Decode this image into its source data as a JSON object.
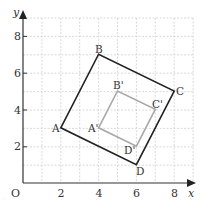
{
  "diagram": {
    "type": "coordinate-grid-enlargement",
    "axes": {
      "x_label": "x",
      "y_label": "y",
      "origin_label": "O",
      "x_ticks": [
        "2",
        "4",
        "6",
        "8"
      ],
      "y_ticks": [
        "2",
        "4",
        "6",
        "8"
      ],
      "x_range": [
        0,
        9
      ],
      "y_range": [
        0,
        9
      ],
      "grid": true
    },
    "colors": {
      "grid": "#d0d0d0",
      "axis": "#333333",
      "original_shape": "#222222",
      "image_shape": "#a8a8a8"
    },
    "original_shape": {
      "name": "ABCD",
      "vertices": [
        {
          "label": "A",
          "x": 2,
          "y": 3
        },
        {
          "label": "B",
          "x": 4,
          "y": 7
        },
        {
          "label": "C",
          "x": 8,
          "y": 5
        },
        {
          "label": "D",
          "x": 6,
          "y": 1
        }
      ]
    },
    "image_shape": {
      "name": "A'B'C'D'",
      "vertices": [
        {
          "label": "A'",
          "x": 4,
          "y": 3
        },
        {
          "label": "B'",
          "x": 5,
          "y": 5
        },
        {
          "label": "C'",
          "x": 7,
          "y": 4
        },
        {
          "label": "D'",
          "x": 6,
          "y": 2
        }
      ]
    }
  }
}
